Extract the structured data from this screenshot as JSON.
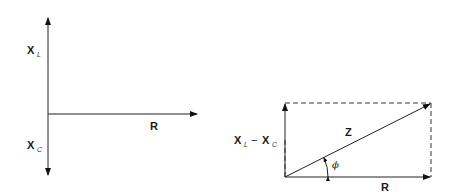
{
  "diagram": {
    "left_phasor": {
      "labels": {
        "inductive_main": "X",
        "inductive_sub": "L",
        "capacitive_main": "X",
        "capacitive_sub": "C",
        "resistance": "R"
      }
    },
    "right_impedance_triangle": {
      "labels": {
        "reactance_main1": "X",
        "reactance_sub1": "L",
        "minus": "−",
        "reactance_main2": "X",
        "reactance_sub2": "C",
        "impedance": "Z",
        "angle": "ϕ",
        "resistance": "R"
      }
    }
  }
}
